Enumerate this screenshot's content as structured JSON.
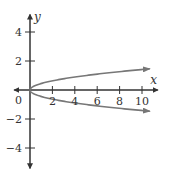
{
  "chart_data": {
    "type": "line",
    "title": "",
    "xlabel": "x",
    "ylabel": "y",
    "xlim": [
      -1.4,
      11.4
    ],
    "ylim": [
      -5.4,
      5.2
    ],
    "grid": false,
    "legend": null,
    "origin_label": "0",
    "x_ticks": [
      2,
      4,
      6,
      8,
      10
    ],
    "x_tick_labels": [
      "2",
      "4",
      "6",
      "8",
      "10"
    ],
    "y_ticks": [
      4,
      2,
      -2,
      -4
    ],
    "y_tick_labels": [
      "4",
      "2",
      "−2",
      "−4"
    ],
    "series": [
      {
        "name": "upper branch",
        "description": "y = sqrt(x/5), arrow at end",
        "x": [
          0,
          0.5,
          1,
          2,
          4,
          6,
          8,
          10,
          10.7
        ],
        "y": [
          0,
          0.32,
          0.45,
          0.63,
          0.89,
          1.1,
          1.26,
          1.41,
          1.46
        ]
      },
      {
        "name": "lower branch",
        "description": "y = -sqrt(x/5), arrow at end",
        "x": [
          0,
          0.5,
          1,
          2,
          4,
          6,
          8,
          10,
          10.7
        ],
        "y": [
          0,
          -0.32,
          -0.45,
          -0.63,
          -0.89,
          -1.1,
          -1.26,
          -1.41,
          -1.46
        ]
      }
    ]
  },
  "colors": {
    "axis": "#333333",
    "curve": "#777777"
  }
}
